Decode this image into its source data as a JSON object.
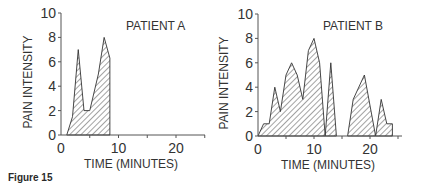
{
  "caption": "Figure 15",
  "chart_data": [
    {
      "type": "area",
      "title": "PATIENT A",
      "xlabel": "TIME (MINUTES)",
      "ylabel": "PAIN INTENSITY",
      "xlim": [
        0,
        25
      ],
      "ylim": [
        0,
        10
      ],
      "xticks": [
        0,
        10,
        20
      ],
      "yticks": [
        0,
        2,
        4,
        6,
        8,
        10
      ],
      "grid": false,
      "fill": "hatched",
      "x": [
        1,
        2,
        3,
        4,
        5,
        6.5,
        7.5,
        8.5,
        8.5
      ],
      "values": [
        0,
        1.5,
        7,
        2,
        2,
        5,
        8,
        6.3,
        0
      ]
    },
    {
      "type": "area",
      "title": "PATIENT B",
      "xlabel": "TIME (MINUTES)",
      "ylabel": "PAIN INTENSITY",
      "xlim": [
        0,
        25
      ],
      "ylim": [
        0,
        10
      ],
      "xticks": [
        0,
        10,
        20
      ],
      "yticks": [
        0,
        2,
        4,
        6,
        8,
        10
      ],
      "grid": false,
      "fill": "hatched",
      "segments": [
        {
          "x": [
            0,
            1,
            2,
            3,
            4,
            5,
            6,
            7,
            8,
            9,
            10,
            11,
            12
          ],
          "values": [
            0,
            1,
            1,
            4,
            2,
            5,
            6,
            5,
            3,
            7,
            8,
            6,
            0
          ]
        },
        {
          "x": [
            12,
            13,
            14
          ],
          "values": [
            0,
            6,
            0
          ]
        },
        {
          "x": [
            16,
            17,
            19,
            21
          ],
          "values": [
            0,
            3,
            5,
            0
          ]
        },
        {
          "x": [
            21,
            22,
            23,
            24,
            24
          ],
          "values": [
            0,
            3,
            1,
            1,
            0
          ]
        }
      ]
    }
  ],
  "panels": {
    "a": {
      "title": "PATIENT A",
      "ylabel": "PAIN INTENSITY",
      "xlabel": "TIME (MINUTES)"
    },
    "b": {
      "title": "PATIENT B",
      "ylabel": "PAIN INTENSITY",
      "xlabel": "TIME (MINUTES)"
    }
  }
}
